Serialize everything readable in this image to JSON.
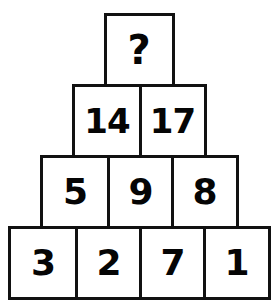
{
  "puzzle": {
    "type": "number-pyramid",
    "background_color": "#ffffff",
    "border_color": "#111111",
    "text_color": "#050505",
    "rows": [
      {
        "index": 1,
        "name": "pyramid-row-top",
        "cells": [
          {
            "value": "?",
            "is_unknown": true
          }
        ]
      },
      {
        "index": 2,
        "name": "pyramid-row-2",
        "cells": [
          {
            "value": "14",
            "is_unknown": false
          },
          {
            "value": "17",
            "is_unknown": false
          }
        ]
      },
      {
        "index": 3,
        "name": "pyramid-row-3",
        "cells": [
          {
            "value": "5",
            "is_unknown": false
          },
          {
            "value": "9",
            "is_unknown": false
          },
          {
            "value": "8",
            "is_unknown": false
          }
        ]
      },
      {
        "index": 4,
        "name": "pyramid-row-bottom",
        "cells": [
          {
            "value": "3",
            "is_unknown": false
          },
          {
            "value": "2",
            "is_unknown": false
          },
          {
            "value": "7",
            "is_unknown": false
          },
          {
            "value": "1",
            "is_unknown": false
          }
        ]
      }
    ]
  }
}
